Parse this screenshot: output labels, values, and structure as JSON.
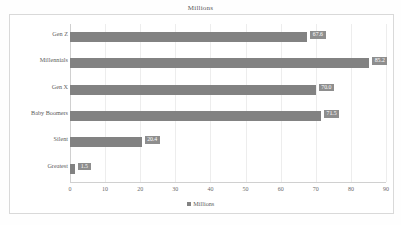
{
  "chart_data": {
    "type": "bar",
    "orientation": "horizontal",
    "title": "Millions",
    "xlabel": "",
    "ylabel": "",
    "xlim": [
      0,
      90
    ],
    "grid": true,
    "legend_position": "bottom",
    "legend": [
      "Millions"
    ],
    "categories": [
      "Gen Z",
      "Millennials",
      "Gen X",
      "Baby Boomers",
      "Silent",
      "Greatest"
    ],
    "values": [
      67.6,
      85.2,
      70.0,
      71.5,
      20.4,
      1.5
    ],
    "data_labels": [
      "67.6",
      "85.2",
      "70.0",
      "71.5",
      "20.4",
      "1.5"
    ],
    "xticks": [
      0,
      10,
      20,
      30,
      40,
      50,
      60,
      70,
      80,
      90
    ],
    "xtick_labels": [
      "0",
      "10",
      "20",
      "30",
      "40",
      "50",
      "60",
      "70",
      "80",
      "90"
    ],
    "series": [
      {
        "name": "Millions",
        "color": "#828282",
        "values": [
          67.6,
          85.2,
          70.0,
          71.5,
          20.4,
          1.5
        ]
      }
    ]
  },
  "colors": {
    "bar": "#828282",
    "label_badge": "#8e8e8e",
    "label_text": "#ffffff",
    "grid": "#ededed",
    "axis": "#d0d0d0",
    "text": "#5c5c5c",
    "border": "#d9d9d9",
    "background": "#ffffff"
  }
}
